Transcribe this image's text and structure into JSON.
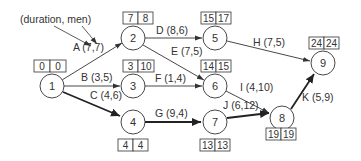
{
  "annotation": {
    "label": "(duration, men)"
  },
  "nodes": [
    {
      "id": "1",
      "x": 52,
      "y": 86,
      "es": "0",
      "ls": "0",
      "box": "above"
    },
    {
      "id": "2",
      "x": 133,
      "y": 38,
      "es": "7",
      "ls": "8",
      "box": "above"
    },
    {
      "id": "3",
      "x": 133,
      "y": 86,
      "es": "3",
      "ls": "10",
      "box": "above"
    },
    {
      "id": "4",
      "x": 133,
      "y": 122,
      "es": "4",
      "ls": "4",
      "box": "below"
    },
    {
      "id": "5",
      "x": 215,
      "y": 38,
      "es": "15",
      "ls": "17",
      "box": "above"
    },
    {
      "id": "6",
      "x": 215,
      "y": 86,
      "es": "14",
      "ls": "15",
      "box": "above"
    },
    {
      "id": "7",
      "x": 215,
      "y": 122,
      "es": "13",
      "ls": "13",
      "box": "below"
    },
    {
      "id": "8",
      "x": 282,
      "y": 118,
      "es": "19",
      "ls": "19",
      "box": "below"
    },
    {
      "id": "9",
      "x": 323,
      "y": 63,
      "es": "24",
      "ls": "24",
      "box": "above"
    }
  ],
  "activities": [
    {
      "label": "A (7,7)",
      "from": "1",
      "to": "2",
      "critical": false
    },
    {
      "label": "B (3,5)",
      "from": "1",
      "to": "3",
      "critical": false
    },
    {
      "label": "C (4,6)",
      "from": "1",
      "to": "4",
      "critical": true
    },
    {
      "label": "D (8,6)",
      "from": "2",
      "to": "5",
      "critical": false
    },
    {
      "label": "E (7,5)",
      "from": "2",
      "to": "6",
      "critical": false
    },
    {
      "label": "F (1,4)",
      "from": "3",
      "to": "6",
      "critical": false
    },
    {
      "label": "G (9,4)",
      "from": "4",
      "to": "7",
      "critical": true
    },
    {
      "label": "H (7,5)",
      "from": "5",
      "to": "9",
      "critical": false
    },
    {
      "label": "I (4,10)",
      "from": "6",
      "to": "8",
      "critical": false
    },
    {
      "label": "J (6,12)",
      "from": "7",
      "to": "8",
      "critical": true
    },
    {
      "label": "K (5,9)",
      "from": "8",
      "to": "9",
      "critical": true
    }
  ]
}
